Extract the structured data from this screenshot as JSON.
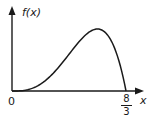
{
  "diagram": {
    "title": "",
    "y_axis_label": "f(x)",
    "x_axis_label": "x",
    "origin_label": "0",
    "x_end_label": {
      "numerator": "8",
      "denominator": "3"
    },
    "colors": {
      "stroke": "#1a1a1a",
      "background": "#ffffff"
    }
  },
  "chart_data": {
    "type": "line",
    "title": "",
    "xlabel": "x",
    "ylabel": "f(x)",
    "x_range": [
      0,
      2.6667
    ],
    "x_tick_labels": [
      "0",
      "8/3"
    ],
    "grid": false,
    "legend": null,
    "series": [
      {
        "name": "f(x)",
        "description": "Unimodal probability density curve starting at 0 at x=0, rising slowly, peaking near x≈2 (about 3/4 of the interval), then falling steeply to 0 at x=8/3",
        "x": [
          0,
          0.333,
          0.667,
          1.0,
          1.333,
          1.667,
          2.0,
          2.333,
          2.5,
          2.667
        ],
        "y_relative": [
          0,
          0.02,
          0.12,
          0.32,
          0.59,
          0.88,
          1.0,
          0.79,
          0.49,
          0
        ]
      }
    ]
  }
}
